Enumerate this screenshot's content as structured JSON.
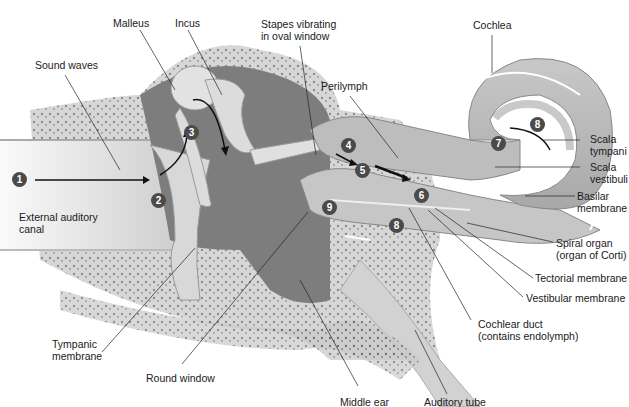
{
  "labels": {
    "malleus": "Malleus",
    "incus": "Incus",
    "stapes_1": "Stapes vibrating",
    "stapes_2": "in oval window",
    "cochlea": "Cochlea",
    "sound_waves": "Sound waves",
    "perilymph": "Perilymph",
    "scala_tympani_1": "Scala",
    "scala_tympani_2": "tympani",
    "scala_vestibuli_1": "Scala",
    "scala_vestibuli_2": "vestibuli",
    "basilar_1": "Basilar",
    "basilar_2": "membrane",
    "external_canal_1": "External auditory",
    "external_canal_2": "canal",
    "spiral_organ_1": "Spiral organ",
    "spiral_organ_2": "(organ of Corti)",
    "tectorial": "Tectorial membrane",
    "vestibular": "Vestibular membrane",
    "cochlear_duct_1": "Cochlear duct",
    "cochlear_duct_2": "(contains endolymph)",
    "tympanic_1": "Tympanic",
    "tympanic_2": "membrane",
    "round_window": "Round window",
    "middle_ear": "Middle ear",
    "auditory_tube": "Auditory tube"
  },
  "steps": [
    "1",
    "2",
    "3",
    "4",
    "5",
    "6",
    "7",
    "8",
    "8",
    "9"
  ]
}
